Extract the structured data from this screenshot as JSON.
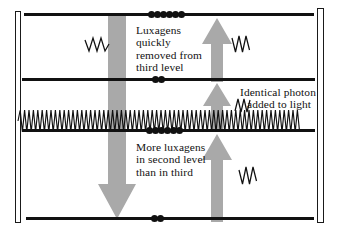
{
  "diagram": {
    "type": "laser-energy-level-diagram",
    "title_text": "",
    "colors": {
      "level_line": "#111111",
      "arrow_gray": "#a8a8a8",
      "arrow_gray_dark": "#9a9a9a",
      "mirror_outline": "#1a1a1a",
      "background": "#ffffff",
      "dot": "#111111"
    },
    "mirrors": [
      {
        "name": "left-mirror",
        "label": ""
      },
      {
        "name": "right-mirror",
        "label": ""
      }
    ],
    "levels": [
      {
        "name": "level-top",
        "dot_count": 6,
        "y": 15
      },
      {
        "name": "level-second",
        "dot_count": 2,
        "y": 80
      },
      {
        "name": "level-third",
        "dot_count": 6,
        "y": 131
      },
      {
        "name": "level-ground",
        "dot_count": 2,
        "y": 219
      }
    ],
    "annotations": [
      {
        "name": "note-luxagens-removed",
        "lines": [
          "Luxagens",
          "quickly",
          "removed from",
          "third level"
        ]
      },
      {
        "name": "note-identical-photon",
        "lines": [
          "Identical photon",
          "added to light"
        ]
      },
      {
        "name": "note-more-luxagens",
        "lines": [
          "More luxagens",
          "in second level",
          "than in third"
        ]
      }
    ],
    "arrows": [
      {
        "name": "down-arrow-decay",
        "direction": "down"
      },
      {
        "name": "up-arrow-pump-top",
        "direction": "up"
      },
      {
        "name": "up-arrow-pump-mid",
        "direction": "up"
      },
      {
        "name": "up-arrow-pump-low",
        "direction": "up"
      }
    ],
    "photons": [
      {
        "name": "photon-wavelet-left",
        "glyph": "zigzag"
      },
      {
        "name": "photon-wavelet-top-right",
        "glyph": "zigzag"
      },
      {
        "name": "photon-wavelet-mid-right",
        "glyph": "zigzag"
      },
      {
        "name": "photon-wavelet-low-right",
        "glyph": "zigzag"
      },
      {
        "name": "light-beam-standing-wave",
        "glyph": "sine-wave"
      }
    ]
  },
  "annotation_text": {
    "note1_line1": "Luxagens",
    "note1_line2": "quickly",
    "note1_line3": "removed from",
    "note1_line4": "third level",
    "note2_line1": "Identical photon",
    "note2_line2": "added to light",
    "note3_line1": "More luxagens",
    "note3_line2": "in second level",
    "note3_line3": "than in third"
  }
}
